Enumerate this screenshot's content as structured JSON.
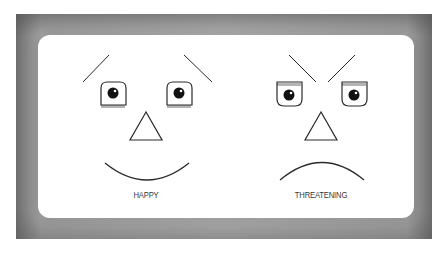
{
  "faces": [
    {
      "id": "happy",
      "label": "HAPPY",
      "brows": "raised-outward",
      "eyes": "lashes-bottom",
      "mouth": "smile"
    },
    {
      "id": "threatening",
      "label": "THREATENING",
      "brows": "angled-inward",
      "eyes": "lashes-top",
      "mouth": "frown"
    }
  ],
  "colors": {
    "line": "#2a2a2a",
    "frame": "#a0a0a0",
    "panel": "#ffffff"
  }
}
